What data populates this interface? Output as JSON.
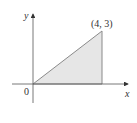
{
  "diagram": {
    "type": "coordinate-region",
    "axes": {
      "x_label": "x",
      "y_label": "y",
      "origin_label": "0"
    },
    "region": {
      "shape": "triangle",
      "vertices": [
        [
          0,
          0
        ],
        [
          4,
          0
        ],
        [
          4,
          3
        ]
      ],
      "fill": "#e6e6e6",
      "stroke": "#8a8a8a"
    },
    "point_label": "(4, 3)"
  }
}
